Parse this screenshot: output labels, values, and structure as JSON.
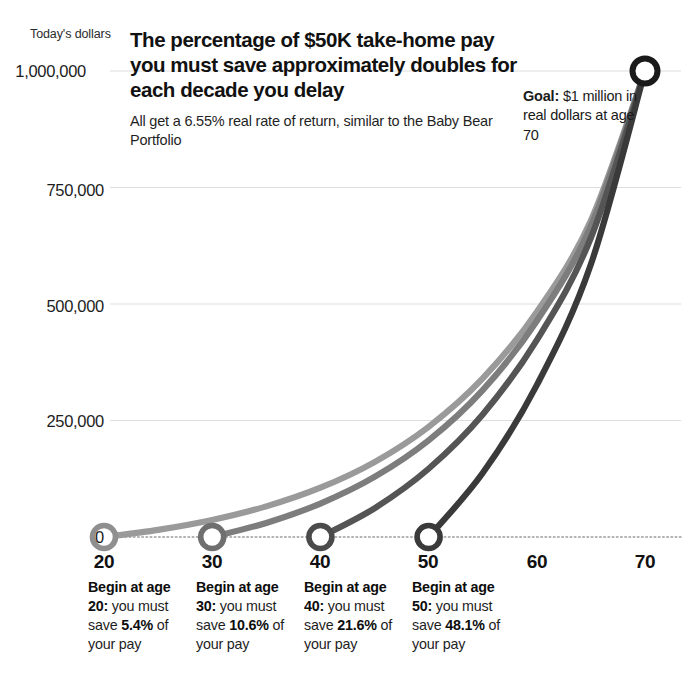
{
  "headline": {
    "title": "The percentage of $50K take-home pay you must save approximately doubles for each decade you delay",
    "subtitle": "All get a 6.55% real rate of return, similar to the Baby Bear Portfolio"
  },
  "goal_annotation": {
    "lead": "Goal:",
    "rest": " $1 million in real dollars at age 70"
  },
  "captions": [
    {
      "lead": "Begin at age 20:",
      "mid": " you must save ",
      "pct": "5.4%",
      "tail": " of your pay"
    },
    {
      "lead": "Begin at age 30:",
      "mid": " you must save ",
      "pct": "10.6%",
      "tail": " of your pay"
    },
    {
      "lead": "Begin at age 40:",
      "mid": " you must save ",
      "pct": "21.6%",
      "tail": " of your pay"
    },
    {
      "lead": "Begin at age 50:",
      "mid": " you must save ",
      "pct": "48.1%",
      "tail": " of your pay"
    }
  ],
  "chart_data": {
    "type": "line",
    "title": "The percentage of $50K take-home pay you must save approximately doubles for each decade you delay",
    "subtitle": "All get a 6.55% real rate of return, similar to the Baby Bear Portfolio",
    "xlabel": "",
    "ylabel": "Today's dollars",
    "y_unit_label": "Today's dollars",
    "xlim": [
      20,
      70
    ],
    "ylim": [
      0,
      1000000
    ],
    "x_ticks": [
      20,
      30,
      40,
      50,
      60,
      70
    ],
    "x_tick_labels": [
      "20",
      "30",
      "40",
      "50",
      "60",
      "70"
    ],
    "y_ticks": [
      0,
      250000,
      500000,
      750000,
      1000000
    ],
    "y_tick_labels": [
      "0",
      "250,000",
      "500,000",
      "750,000",
      "1,000,000"
    ],
    "grid": true,
    "legend": "none",
    "rate_of_return_pct": 6.55,
    "goal_value": 1000000,
    "goal_age": 70,
    "annual_take_home_pay": 50000,
    "series": [
      {
        "name": "Begin at age 20",
        "start_age": 20,
        "save_pct": 5.4,
        "color": "#9a9a9a",
        "x": [
          20,
          25,
          30,
          35,
          40,
          45,
          50,
          55,
          60,
          65,
          70
        ],
        "values": [
          0,
          15400,
          36600,
          65700,
          105700,
          160700,
          236300,
          340200,
          483000,
          679300,
          1000000
        ]
      },
      {
        "name": "Begin at age 30",
        "start_age": 30,
        "save_pct": 10.6,
        "color": "#7d7d7d",
        "x": [
          30,
          35,
          40,
          45,
          50,
          55,
          60,
          65,
          70
        ],
        "values": [
          0,
          30200,
          71800,
          128900,
          207400,
          315300,
          463600,
          667400,
          1000000
        ]
      },
      {
        "name": "Begin at age 40",
        "start_age": 40,
        "save_pct": 21.6,
        "color": "#555555",
        "x": [
          40,
          45,
          50,
          55,
          60,
          65,
          70
        ],
        "values": [
          0,
          61600,
          146400,
          262800,
          422600,
          642200,
          1000000
        ]
      },
      {
        "name": "Begin at age 50",
        "start_age": 50,
        "save_pct": 48.1,
        "color": "#3a3a3a",
        "x": [
          50,
          55,
          60,
          65,
          70
        ],
        "values": [
          0,
          137200,
          325900,
          585200,
          1000000
        ]
      }
    ],
    "markers": [
      {
        "label": "20",
        "age": 20,
        "value": 0
      },
      {
        "label": "30",
        "age": 30,
        "value": 0
      },
      {
        "label": "40",
        "age": 40,
        "value": 0
      },
      {
        "label": "50",
        "age": 50,
        "value": 0
      },
      {
        "label": "70",
        "age": 70,
        "value": 1000000
      }
    ]
  }
}
